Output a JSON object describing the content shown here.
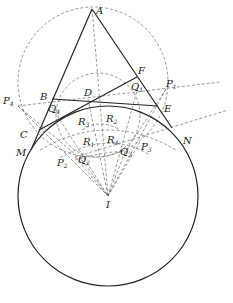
{
  "diagram": {
    "type": "geometry",
    "points": {
      "A": {
        "label": "A"
      },
      "B": {
        "label": "B"
      },
      "C": {
        "label": "C"
      },
      "D": {
        "label": "D"
      },
      "E": {
        "label": "E"
      },
      "F": {
        "label": "F"
      },
      "M": {
        "label": "M"
      },
      "N": {
        "label": "N"
      },
      "I": {
        "label": "I"
      },
      "P1": {
        "label": "P",
        "sub": "1"
      },
      "P2": {
        "label": "P",
        "sub": "2"
      },
      "P3": {
        "label": "P",
        "sub": "3"
      },
      "P4": {
        "label": "P",
        "sub": "4"
      },
      "Q1": {
        "label": "Q",
        "sub": "1"
      },
      "Q2": {
        "label": "Q",
        "sub": "2"
      },
      "Q3": {
        "label": "Q",
        "sub": "3"
      },
      "Q4": {
        "label": "Q",
        "sub": "4"
      },
      "R1": {
        "label": "R",
        "sub": "1"
      },
      "R2": {
        "label": "R",
        "sub": "2"
      },
      "R3": {
        "label": "R",
        "sub": "3"
      },
      "R4": {
        "label": "R",
        "sub": "4"
      }
    },
    "colors": {
      "line": "#222222",
      "dashed": "#555555",
      "background": "#ffffff"
    }
  }
}
